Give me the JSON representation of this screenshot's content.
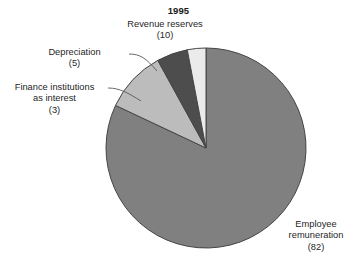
{
  "chart_data": {
    "type": "pie",
    "title": "1995",
    "subtitle": "",
    "xlabel": "",
    "ylabel": "",
    "legend_position": "none",
    "grid": false,
    "total": 100,
    "start_angle_deg": 0,
    "direction": "clockwise",
    "categories": [
      "Employee remuneration",
      "Revenue reserves",
      "Depreciation",
      "Finance institutions as interest"
    ],
    "values": [
      82,
      10,
      5,
      3
    ],
    "slices": [
      {
        "label": "Employee remuneration",
        "label_lines": [
          "Employee",
          "remuneration",
          "(82)"
        ],
        "value": 82,
        "value_text": "(82)",
        "percent": 82,
        "angle_deg": 295.2,
        "color": "#808080",
        "has_leader_line": false
      },
      {
        "label": "Revenue reserves",
        "label_lines": [
          "Revenue reserves",
          "(10)"
        ],
        "value": 10,
        "value_text": "(10)",
        "percent": 10,
        "angle_deg": 36.0,
        "color": "#bcbcbc",
        "has_leader_line": false
      },
      {
        "label": "Depreciation",
        "label_lines": [
          "Depreciation",
          "(5)"
        ],
        "value": 5,
        "value_text": "(5)",
        "percent": 5,
        "angle_deg": 18.0,
        "color": "#4d4d4d",
        "has_leader_line": true
      },
      {
        "label": "Finance institutions as interest",
        "label_lines": [
          "Finance institutions",
          "as interest",
          "(3)"
        ],
        "value": 3,
        "value_text": "(3)",
        "percent": 3,
        "angle_deg": 10.8,
        "color": "#ebebeb",
        "has_leader_line": true
      }
    ]
  },
  "title": "1995",
  "labels": {
    "revenue_reserves": {
      "line1": "Revenue reserves",
      "line2": "(10)"
    },
    "depreciation": {
      "line1": "Depreciation",
      "line2": "(5)"
    },
    "finance_institutions": {
      "line1": "Finance institutions",
      "line2": "as interest",
      "line3": "(3)"
    },
    "employee_remuneration": {
      "line1": "Employee",
      "line2": "remuneration",
      "line3": "(82)"
    }
  },
  "colors": {
    "employee": "#808080",
    "revenue": "#bcbcbc",
    "depreciation": "#4d4d4d",
    "finance": "#ebebeb",
    "outline": "#454545",
    "background": "#ffffff",
    "text": "#262626"
  }
}
